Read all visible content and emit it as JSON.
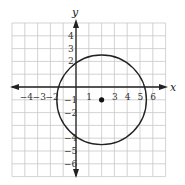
{
  "chart_data": {
    "type": "scatter",
    "title": "",
    "xlabel": "x",
    "ylabel": "y",
    "xlim": [
      -4,
      6
    ],
    "ylim": [
      -6,
      4
    ],
    "grid": true,
    "x_tick_labels": [
      "-4",
      "-3",
      "-2",
      "1",
      "3",
      "4",
      "5",
      "6"
    ],
    "y_tick_labels": [
      "4",
      "3",
      "2",
      "-1",
      "-2",
      "-4",
      "-5",
      "-6"
    ],
    "circle": {
      "center": [
        2,
        -1
      ],
      "radius": 3.5
    },
    "points": [
      {
        "x": 2,
        "y": -1,
        "label": "center"
      }
    ]
  }
}
